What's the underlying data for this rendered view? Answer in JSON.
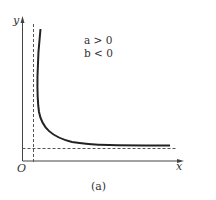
{
  "figure": {
    "caption": "(a)",
    "axes": {
      "x_label": "x",
      "y_label": "y",
      "origin_label": "O"
    },
    "conditions": [
      {
        "var": "a",
        "op": ">",
        "value": "0",
        "text": "a > 0"
      },
      {
        "var": "b",
        "op": "<",
        "value": "0",
        "text": "b < 0"
      }
    ],
    "curve": {
      "description": "hyperbola-like decreasing curve approaching vertical and horizontal asymptotes",
      "color": "#222222"
    },
    "asymptotes": {
      "vertical": "dashed line slightly right of y-axis",
      "horizontal": "dashed line slightly above x-axis"
    },
    "colors": {
      "axis": "#444444",
      "dashed": "#555555",
      "curve": "#222222",
      "text": "#333333"
    }
  }
}
